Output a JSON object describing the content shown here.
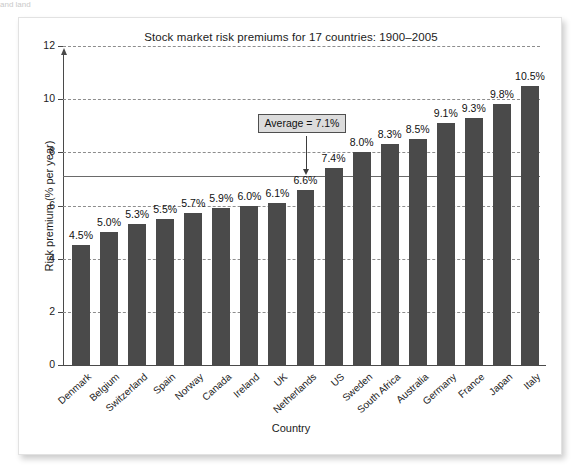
{
  "scan_artifact": "and land",
  "chart_data": {
    "type": "bar",
    "title": "Stock market risk premiums for 17 countries: 1900–2005",
    "xlabel": "Country",
    "ylabel": "Risk premium (% per year)",
    "ylim": [
      0,
      12
    ],
    "ytick_labels": [
      "0",
      "2",
      "4",
      "6",
      "8",
      "10",
      "12"
    ],
    "ytick_values": [
      0,
      2,
      4,
      6,
      8,
      10,
      12
    ],
    "grid": "horizontal dashed at 2,4,6,8,10,12",
    "legend": "none",
    "bar_color": "#4a4a4a",
    "categories": [
      "Denmark",
      "Belgium",
      "Switzerland",
      "Spain",
      "Norway",
      "Canada",
      "Ireland",
      "UK",
      "Netherlands",
      "US",
      "Sweden",
      "South Africa",
      "Australia",
      "Germany",
      "France",
      "Japan",
      "Italy"
    ],
    "values": [
      4.5,
      5.0,
      5.3,
      5.5,
      5.7,
      5.9,
      6.0,
      6.1,
      6.6,
      7.4,
      8.0,
      8.3,
      8.5,
      9.1,
      9.3,
      9.8,
      10.5
    ],
    "value_labels": [
      "4.5%",
      "5.0%",
      "5.3%",
      "5.5%",
      "5.7%",
      "5.9%",
      "6.0%",
      "6.1%",
      "6.6%",
      "7.4%",
      "8.0%",
      "8.3%",
      "8.5%",
      "9.1%",
      "9.3%",
      "9.8%",
      "10.5%"
    ],
    "annotations": [
      {
        "name": "average-reference-line",
        "label": "Average = 7.1%",
        "value": 7.1,
        "style": "solid horizontal line with callout box and downward arrow"
      }
    ]
  }
}
